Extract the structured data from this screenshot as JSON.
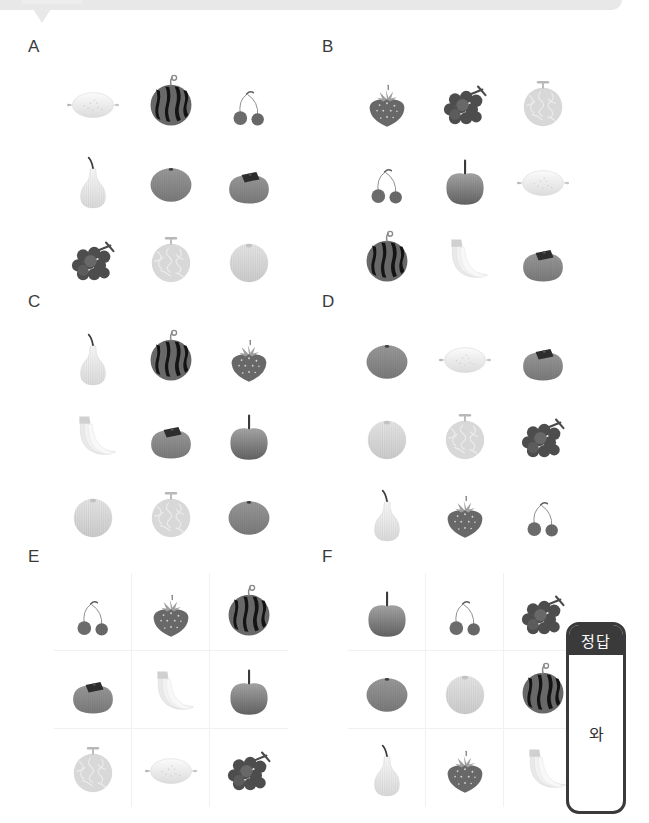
{
  "banner": {
    "label": ""
  },
  "panels": [
    {
      "label": "A",
      "bordered": false,
      "items": [
        "lemon",
        "watermelon",
        "cherry",
        "pear",
        "orange",
        "persimmon",
        "grapes",
        "melon",
        "peach"
      ]
    },
    {
      "label": "B",
      "bordered": false,
      "items": [
        "strawberry",
        "grapes",
        "melon",
        "cherry",
        "apple",
        "lemon",
        "watermelon",
        "banana",
        "persimmon"
      ]
    },
    {
      "label": "C",
      "bordered": false,
      "items": [
        "pear",
        "watermelon",
        "strawberry",
        "banana",
        "persimmon",
        "apple",
        "peach",
        "melon",
        "orange"
      ]
    },
    {
      "label": "D",
      "bordered": false,
      "items": [
        "orange",
        "lemon",
        "persimmon",
        "peach",
        "melon",
        "grapes",
        "pear",
        "strawberry",
        "cherry"
      ]
    },
    {
      "label": "E",
      "bordered": true,
      "items": [
        "cherry",
        "strawberry",
        "watermelon",
        "persimmon",
        "banana",
        "apple",
        "melon",
        "lemon",
        "grapes"
      ]
    },
    {
      "label": "F",
      "bordered": true,
      "items": [
        "apple",
        "cherry",
        "grapes",
        "orange",
        "peach",
        "watermelon",
        "pear",
        "strawberry",
        "banana"
      ]
    }
  ],
  "answer_card": {
    "header": "정답",
    "value": "와"
  },
  "colors": {
    "banner": "#e8e8e8",
    "label_text": "#3a3a3a",
    "card_border": "#3a3a3a",
    "card_header_bg": "#3a3a3a",
    "card_header_text": "#ffffff",
    "cell_divider": "#f1f1f1",
    "page_bg": "#ffffff"
  }
}
